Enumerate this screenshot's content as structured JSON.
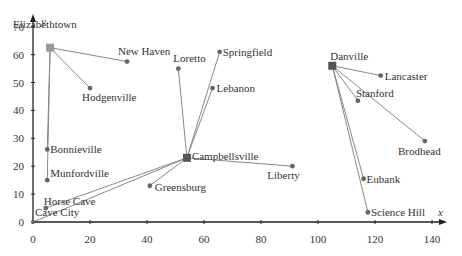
{
  "chart_data": {
    "type": "scatter",
    "title": "",
    "xlabel": "x",
    "ylabel": "y",
    "xlim": [
      0,
      145
    ],
    "ylim": [
      0,
      75
    ],
    "x_ticks": [
      "0",
      "20",
      "40",
      "60",
      "80",
      "100",
      "120",
      "140"
    ],
    "y_ticks": [
      "0",
      "10",
      "20",
      "30",
      "40",
      "50",
      "60",
      "70"
    ],
    "grid": false,
    "hubs": [
      {
        "name": "Elizabethtown",
        "x": 6,
        "y": 62.5
      },
      {
        "name": "Campbellsville",
        "x": 54,
        "y": 23
      },
      {
        "name": "Danville",
        "x": 105,
        "y": 56
      }
    ],
    "points": [
      {
        "name": "Elizabethtown",
        "x": 6,
        "y": 62.5
      },
      {
        "name": "New Haven",
        "x": 33,
        "y": 57.5
      },
      {
        "name": "Hodgenville",
        "x": 20,
        "y": 48
      },
      {
        "name": "Bonnieville",
        "x": 5,
        "y": 26
      },
      {
        "name": "Munfordville",
        "x": 5,
        "y": 15
      },
      {
        "name": "Horse Cave",
        "x": 4.5,
        "y": 5
      },
      {
        "name": "Cave City",
        "x": 0,
        "y": 0
      },
      {
        "name": "Loretto",
        "x": 51,
        "y": 55
      },
      {
        "name": "Springfield",
        "x": 65.5,
        "y": 61
      },
      {
        "name": "Lebanon",
        "x": 63,
        "y": 48
      },
      {
        "name": "Campbellsville",
        "x": 54,
        "y": 23
      },
      {
        "name": "Greensburg",
        "x": 41,
        "y": 13
      },
      {
        "name": "Liberty",
        "x": 91,
        "y": 20
      },
      {
        "name": "Danville",
        "x": 105,
        "y": 56
      },
      {
        "name": "Lancaster",
        "x": 122,
        "y": 52.5
      },
      {
        "name": "Stanford",
        "x": 114,
        "y": 43.5
      },
      {
        "name": "Brodhead",
        "x": 137.5,
        "y": 29
      },
      {
        "name": "Eubank",
        "x": 116,
        "y": 15.5
      },
      {
        "name": "Science Hill",
        "x": 117.5,
        "y": 3.5
      }
    ],
    "edges": [
      [
        "Elizabethtown",
        "New Haven"
      ],
      [
        "Elizabethtown",
        "Hodgenville"
      ],
      [
        "Elizabethtown",
        "Bonnieville"
      ],
      [
        "Elizabethtown",
        "Munfordville"
      ],
      [
        "Campbellsville",
        "Horse Cave"
      ],
      [
        "Campbellsville",
        "Cave City"
      ],
      [
        "Campbellsville",
        "Greensburg"
      ],
      [
        "Campbellsville",
        "Loretto"
      ],
      [
        "Campbellsville",
        "Springfield"
      ],
      [
        "Campbellsville",
        "Lebanon"
      ],
      [
        "Campbellsville",
        "Liberty"
      ],
      [
        "Danville",
        "Lancaster"
      ],
      [
        "Danville",
        "Stanford"
      ],
      [
        "Danville",
        "Brodhead"
      ],
      [
        "Danville",
        "Eubank"
      ],
      [
        "Danville",
        "Science Hill"
      ]
    ]
  },
  "labels": {
    "x_axis": "x",
    "y_axis": "y"
  }
}
